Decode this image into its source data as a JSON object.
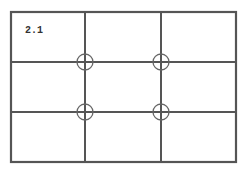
{
  "diagram": {
    "label": "2.1",
    "type": "rule-of-thirds-grid",
    "rows": 3,
    "columns": 3,
    "line_color": "#555555",
    "intersection_markers": [
      {
        "name": "top-left",
        "x": 85,
        "y": 62
      },
      {
        "name": "top-right",
        "x": 161,
        "y": 62
      },
      {
        "name": "bottom-left",
        "x": 85,
        "y": 112
      },
      {
        "name": "bottom-right",
        "x": 161,
        "y": 112
      }
    ]
  }
}
